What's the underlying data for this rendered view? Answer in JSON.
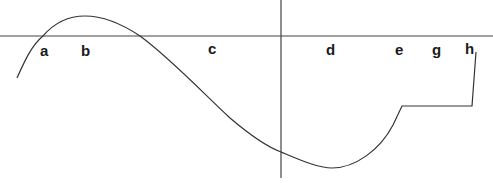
{
  "diagram": {
    "type": "function-curve-sketch",
    "axes": {
      "x_axis": {
        "y": 36,
        "x1": 0,
        "x2": 493
      },
      "y_axis": {
        "x": 281,
        "y1": 0,
        "y2": 178
      }
    },
    "labels": [
      {
        "text": "a",
        "x": 44,
        "y": 56
      },
      {
        "text": "b",
        "x": 85,
        "y": 56
      },
      {
        "text": "c",
        "x": 212,
        "y": 53
      },
      {
        "text": "d",
        "x": 330,
        "y": 55
      },
      {
        "text": "e",
        "x": 399,
        "y": 55
      },
      {
        "text": "g",
        "x": 436,
        "y": 55
      },
      {
        "text": "h",
        "x": 469,
        "y": 54
      }
    ],
    "line_color": "#333333"
  }
}
